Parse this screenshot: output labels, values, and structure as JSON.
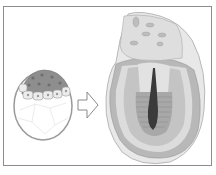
{
  "figure": {
    "panels": [
      {
        "name": "early-embryo",
        "label": ""
      },
      {
        "name": "developed-embryo-section",
        "label": ""
      }
    ],
    "arrow": {
      "direction": "right"
    },
    "colors": {
      "border": "#8c8c8c",
      "cell_dark": "#8e8e8e",
      "cell_light": "#e6e6e6",
      "yolk": "#ffffff",
      "outer_layer": "#c8c8c8",
      "mid_layer": "#b4b4b4",
      "light_layer": "#e4e4e4",
      "cavity": "#3a3a3a",
      "striated": "#a8a8a8"
    }
  }
}
